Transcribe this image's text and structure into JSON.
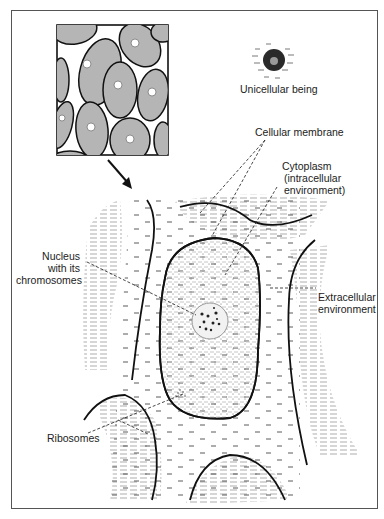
{
  "diagram": {
    "type": "biological illustration",
    "labels": {
      "unicellular": "Unicellular being",
      "membrane": "Cellular membrane",
      "cytoplasm_line1": "Cytoplasm",
      "cytoplasm_line2": "(intracellular",
      "cytoplasm_line3": "environment)",
      "nucleus_line1": "Nucleus",
      "nucleus_line2": "with its",
      "nucleus_line3": "chromosomes",
      "extracellular_line1": "Extracellular",
      "extracellular_line2": "environment",
      "ribosomes": "Ribosomes"
    },
    "colors": {
      "outline": "#111111",
      "cell_fill": "#b8b8b8",
      "shading": "#c9c9c9",
      "leader_line": "#333333"
    }
  }
}
